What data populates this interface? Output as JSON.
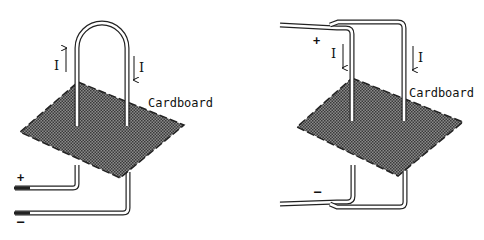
{
  "diagrams": [
    {
      "id": "single-loop",
      "material_label": "Cardboard",
      "current_labels": [
        "I",
        "I"
      ],
      "current_directions": [
        "up",
        "down"
      ],
      "terminal_plus": "+",
      "terminal_minus": "–"
    },
    {
      "id": "parallel-wires",
      "material_label": "Cardboard",
      "current_labels": [
        "I",
        "I"
      ],
      "current_directions": [
        "down",
        "down"
      ],
      "terminal_plus": "+",
      "terminal_minus": "–"
    }
  ],
  "colors": {
    "board": "#6e6e6e",
    "wire_outline": "#222222",
    "wire_fill": "#ffffff"
  }
}
